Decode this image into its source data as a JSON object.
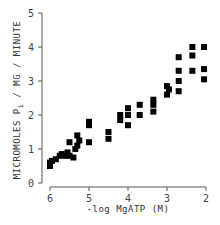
{
  "chart_data": {
    "type": "scatter",
    "title": "",
    "xlabel": "-log MgATP (M)",
    "ylabel": "MICROMOLES Pi / MG / MINUTE",
    "xlim": [
      6,
      2
    ],
    "ylim": [
      0,
      5
    ],
    "x_reversed": true,
    "x_ticks": [
      6,
      5,
      4,
      3,
      2
    ],
    "y_ticks": [
      0,
      1,
      2,
      3,
      4,
      5
    ],
    "grid": false,
    "legend": null,
    "marker": "filled-square",
    "series": [
      {
        "name": "data",
        "points": [
          {
            "x": 6.0,
            "y": 0.5
          },
          {
            "x": 6.0,
            "y": 0.6
          },
          {
            "x": 5.95,
            "y": 0.65
          },
          {
            "x": 5.85,
            "y": 0.7
          },
          {
            "x": 5.75,
            "y": 0.8
          },
          {
            "x": 5.7,
            "y": 0.85
          },
          {
            "x": 5.6,
            "y": 0.8
          },
          {
            "x": 5.55,
            "y": 0.9
          },
          {
            "x": 5.5,
            "y": 0.8
          },
          {
            "x": 5.5,
            "y": 1.2
          },
          {
            "x": 5.4,
            "y": 0.75
          },
          {
            "x": 5.35,
            "y": 1.0
          },
          {
            "x": 5.3,
            "y": 1.1
          },
          {
            "x": 5.3,
            "y": 1.4
          },
          {
            "x": 5.25,
            "y": 1.25
          },
          {
            "x": 5.0,
            "y": 1.2
          },
          {
            "x": 5.0,
            "y": 1.7
          },
          {
            "x": 5.0,
            "y": 1.8
          },
          {
            "x": 4.5,
            "y": 1.3
          },
          {
            "x": 4.5,
            "y": 1.5
          },
          {
            "x": 4.2,
            "y": 1.85
          },
          {
            "x": 4.2,
            "y": 2.0
          },
          {
            "x": 4.0,
            "y": 1.7
          },
          {
            "x": 4.0,
            "y": 2.0
          },
          {
            "x": 4.0,
            "y": 2.2
          },
          {
            "x": 3.7,
            "y": 2.0
          },
          {
            "x": 3.7,
            "y": 2.3
          },
          {
            "x": 3.35,
            "y": 2.1
          },
          {
            "x": 3.35,
            "y": 2.3
          },
          {
            "x": 3.35,
            "y": 2.45
          },
          {
            "x": 3.0,
            "y": 2.6
          },
          {
            "x": 3.0,
            "y": 2.85
          },
          {
            "x": 2.95,
            "y": 2.75
          },
          {
            "x": 2.7,
            "y": 2.7
          },
          {
            "x": 2.7,
            "y": 3.0
          },
          {
            "x": 2.7,
            "y": 3.3
          },
          {
            "x": 2.7,
            "y": 3.7
          },
          {
            "x": 2.35,
            "y": 3.3
          },
          {
            "x": 2.35,
            "y": 3.75
          },
          {
            "x": 2.35,
            "y": 4.0
          },
          {
            "x": 2.05,
            "y": 3.05
          },
          {
            "x": 2.05,
            "y": 3.35
          },
          {
            "x": 2.05,
            "y": 4.0
          }
        ]
      }
    ]
  },
  "axes": {
    "x_title": "-log MgATP (M)",
    "y_title_main": "MICROMOLES P",
    "y_title_sub": "i",
    "y_title_rest": " / MG / MINUTE",
    "x_tick_labels": [
      "6",
      "5",
      "4",
      "3",
      "2"
    ],
    "y_tick_labels": [
      "0",
      "1",
      "2",
      "3",
      "4",
      "5"
    ]
  }
}
